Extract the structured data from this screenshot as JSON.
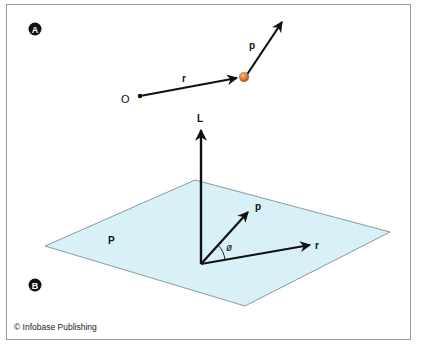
{
  "panel_a": {
    "badge": "A",
    "origin_label": "O",
    "position_vector_label": "r",
    "momentum_vector_label": "p",
    "particle_color": "#d9752f"
  },
  "panel_b": {
    "badge": "B",
    "angular_momentum_label": "L",
    "plane_label": "P",
    "momentum_vector_label": "p",
    "position_vector_label": "r",
    "angle_label": "ø",
    "plane_color": "#d8f1f8"
  },
  "credit": "© Infobase Publishing"
}
